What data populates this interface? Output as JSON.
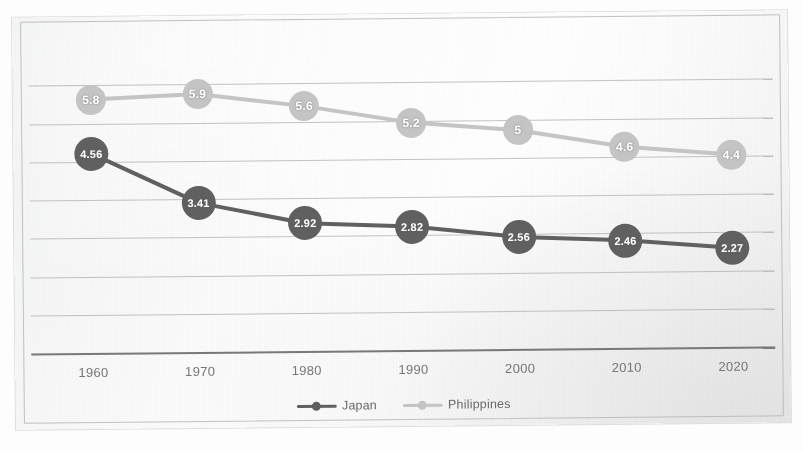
{
  "chart_data": {
    "type": "line",
    "title": "",
    "subtitle": "",
    "xlabel": "",
    "ylabel": "",
    "categories": [
      "1960",
      "1970",
      "1980",
      "1990",
      "2000",
      "2010",
      "2020"
    ],
    "series": [
      {
        "name": "Japan",
        "color": "#595959",
        "marker_color": "#595959",
        "label_color": "#ffffff",
        "values": [
          4.56,
          3.41,
          2.92,
          2.82,
          2.56,
          2.46,
          2.27
        ],
        "value_labels": [
          "4.56",
          "3.41",
          "2.92",
          "2.82",
          "2.56",
          "2.46",
          "2.27"
        ]
      },
      {
        "name": "Philippines",
        "color": "#bfbfbf",
        "marker_color": "#bfbfbf",
        "label_color": "#ffffff",
        "values": [
          5.8,
          5.9,
          5.6,
          5.2,
          5,
          4.6,
          4.4
        ],
        "value_labels": [
          "5.8",
          "5.9",
          "5.6",
          "5.2",
          "5",
          "4.6",
          "4.4"
        ]
      }
    ],
    "ylim": [
      0,
      7
    ],
    "y_tick_labels_visible": false,
    "gridlines": 7,
    "grid": true,
    "legend": [
      "Japan",
      "Philippines"
    ],
    "legend_position": "bottom"
  },
  "legend": {
    "items": [
      {
        "label": "Japan",
        "color": "#595959"
      },
      {
        "label": "Philippines",
        "color": "#bfbfbf"
      }
    ]
  },
  "axis": {
    "x_ticks": [
      "1960",
      "1970",
      "1980",
      "1990",
      "2000",
      "2010",
      "2020"
    ]
  },
  "colors": {
    "japan": "#595959",
    "philippines": "#bfbfbf",
    "gridline": "#a8aaad",
    "axis": "#6f7173",
    "paper": "#f4f4f4"
  }
}
